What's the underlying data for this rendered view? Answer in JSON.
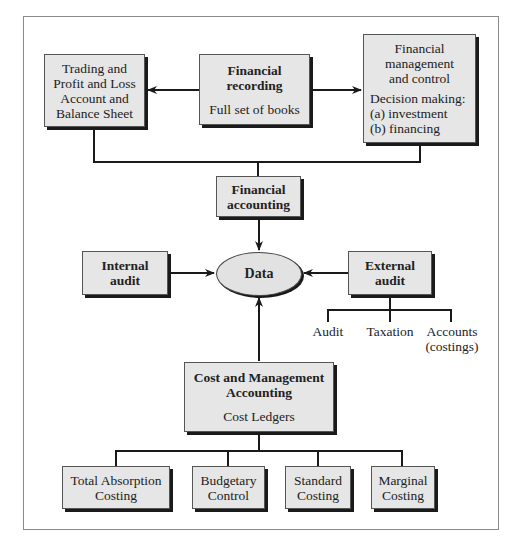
{
  "diagram": {
    "top_row": {
      "trading": {
        "lines": [
          "Trading and",
          "Profit and Loss",
          "Account and",
          "Balance Sheet"
        ]
      },
      "recording": {
        "title_lines": [
          "Financial",
          "recording"
        ],
        "subtitle": "Full set of books"
      },
      "management": {
        "title_lines": [
          "Financial",
          "management",
          "and control"
        ],
        "detail_lines": [
          "Decision making:",
          "(a) investment",
          "(b) financing"
        ]
      }
    },
    "financial_accounting": {
      "lines": [
        "Financial",
        "accounting"
      ]
    },
    "center": {
      "label": "Data"
    },
    "internal_audit": {
      "lines": [
        "Internal",
        "audit"
      ]
    },
    "external_audit": {
      "lines": [
        "External",
        "audit"
      ],
      "children": [
        {
          "label": "Audit"
        },
        {
          "label": "Taxation"
        },
        {
          "label": "Accounts",
          "sub": "(costings)"
        }
      ]
    },
    "cost_management": {
      "title_lines": [
        "Cost and Management",
        "Accounting"
      ],
      "subtitle": "Cost Ledgers"
    },
    "costing_methods": [
      {
        "lines": [
          "Total Absorption",
          "Costing"
        ]
      },
      {
        "lines": [
          "Budgetary",
          "Control"
        ]
      },
      {
        "lines": [
          "Standard",
          "Costing"
        ]
      },
      {
        "lines": [
          "Marginal",
          "Costing"
        ]
      }
    ],
    "colors": {
      "box_fill": "#e6e6e6",
      "line": "#1a1a1a",
      "frame": "#8a8a8a"
    }
  }
}
